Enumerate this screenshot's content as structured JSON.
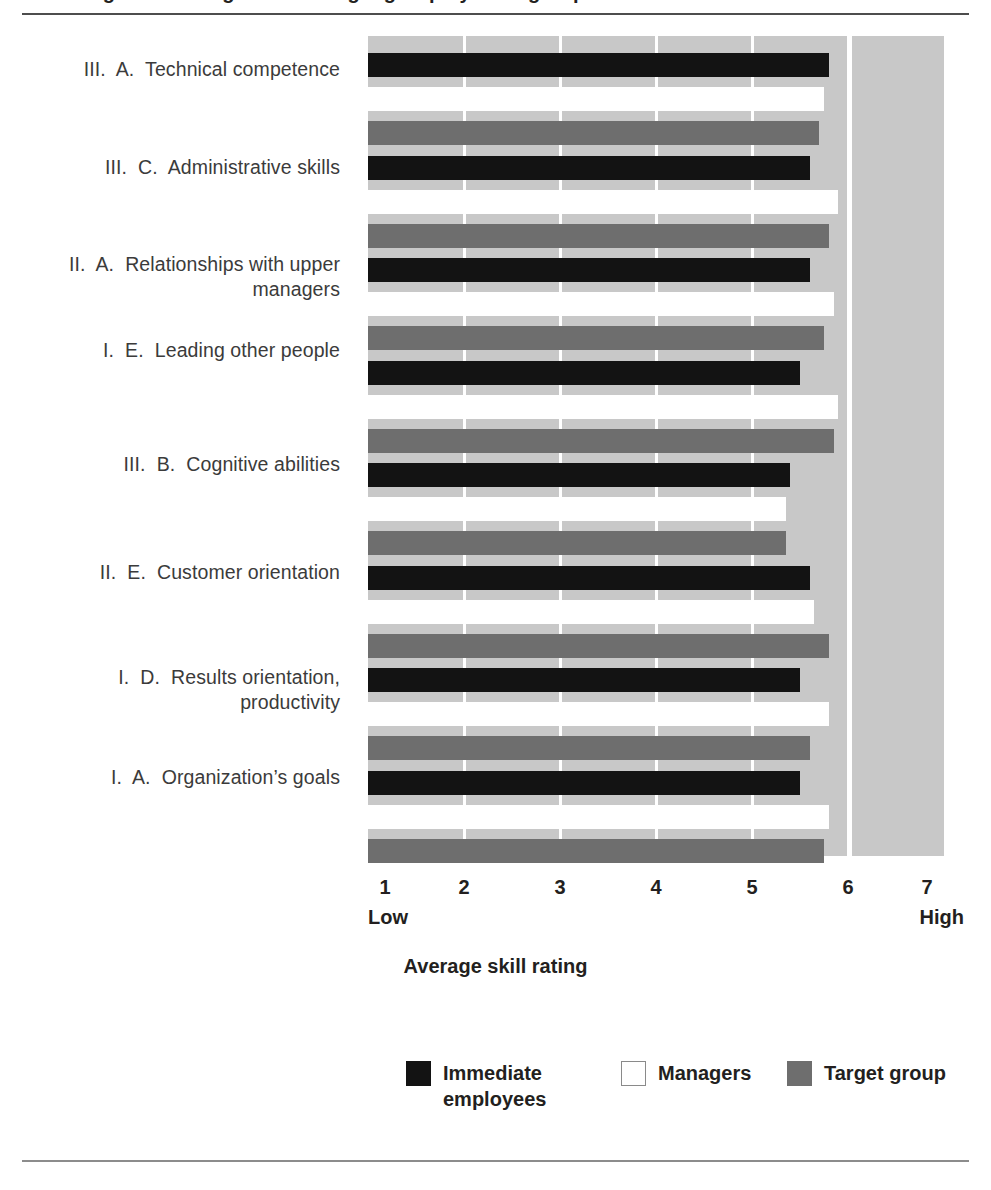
{
  "figure": {
    "title_cropped": "Average skill ratings for the target group by rater group",
    "axis_title": "Average skill rating",
    "low_cap": "Low",
    "high_cap": "High"
  },
  "legend": {
    "items": [
      {
        "label": "Immediate employees",
        "color": "#131313",
        "key": "immediate"
      },
      {
        "label": "Managers",
        "color": "#ffffff",
        "key": "managers"
      },
      {
        "label": "Target group",
        "color": "#6e6e6e",
        "key": "target"
      }
    ]
  },
  "colors": {
    "plot_background": "#c8c8c8",
    "gridline": "#ffffff",
    "immediate": "#131313",
    "managers": "#ffffff",
    "target": "#6e6e6e",
    "text": "#231f20",
    "label_text": "#3b3b3b"
  },
  "chart_data": {
    "type": "bar",
    "orientation": "horizontal",
    "title": "Average skill ratings for the target group by rater group",
    "xlabel": "Average skill rating",
    "ylabel": "",
    "xlim": [
      1,
      7
    ],
    "xticks": [
      1,
      2,
      3,
      4,
      5,
      6,
      7
    ],
    "xtick_labels": [
      "1",
      "2",
      "3",
      "4",
      "5",
      "6",
      "7"
    ],
    "xtick_endpoint_labels": {
      "1": "Low",
      "7": "High"
    },
    "grid": true,
    "legend_position": "bottom",
    "categories": [
      "III. A.  Technical competence",
      "III. C.  Administrative skills",
      "II. A.  Relationships with upper managers",
      "I. E.  Leading other people",
      "III. B.  Cognitive abilities",
      "II. E.  Customer orientation",
      "I. D.  Results orientation, productivity",
      "I. A.  Organization's goals"
    ],
    "series": [
      {
        "name": "Immediate employees",
        "color": "#131313",
        "values": [
          5.8,
          5.6,
          5.6,
          5.5,
          5.4,
          5.6,
          5.5,
          5.5
        ]
      },
      {
        "name": "Managers",
        "color": "#ffffff",
        "values": [
          5.75,
          5.9,
          5.85,
          5.9,
          5.35,
          5.65,
          5.8,
          5.8
        ]
      },
      {
        "name": "Target group",
        "color": "#6e6e6e",
        "values": [
          5.7,
          5.8,
          5.75,
          5.85,
          5.35,
          5.8,
          5.6,
          5.75
        ]
      }
    ]
  },
  "category_labels": [
    {
      "roman": "III.",
      "letter": "A.",
      "line1": "Technical competence",
      "line2": ""
    },
    {
      "roman": "III.",
      "letter": "C.",
      "line1": "Administrative skills",
      "line2": ""
    },
    {
      "roman": "II.",
      "letter": "A.",
      "line1": "Relationships with upper",
      "line2": "managers"
    },
    {
      "roman": "I.",
      "letter": "E.",
      "line1": "Leading other people",
      "line2": ""
    },
    {
      "roman": "III.",
      "letter": "B.",
      "line1": "Cognitive abilities",
      "line2": ""
    },
    {
      "roman": "II.",
      "letter": "E.",
      "line1": "Customer orientation",
      "line2": ""
    },
    {
      "roman": "I.",
      "letter": "D.",
      "line1": "Results orientation,",
      "line2": "productivity"
    },
    {
      "roman": "I.",
      "letter": "A.",
      "line1": "Organization’s goals",
      "line2": ""
    }
  ]
}
